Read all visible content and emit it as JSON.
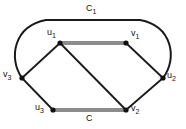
{
  "figure": {
    "kind": "graph-diagram",
    "width": 186,
    "height": 129,
    "background_color": "#ffffff"
  },
  "colors": {
    "edge_dark": "#1a1a1a",
    "edge_highlight": "#8c8c8c",
    "vertex_fill": "#111111",
    "text": "#141414"
  },
  "vertices": [
    {
      "id": "u1",
      "label": "u",
      "sub": "1",
      "x": 60,
      "y": 43,
      "label_x": 47,
      "label_y": 28
    },
    {
      "id": "v1",
      "label": "v",
      "sub": "1",
      "x": 126,
      "y": 43,
      "label_x": 131,
      "label_y": 29
    },
    {
      "id": "v3",
      "label": "v",
      "sub": "3",
      "x": 22,
      "y": 78,
      "label_x": 3,
      "label_y": 70
    },
    {
      "id": "u2",
      "label": "u",
      "sub": "2",
      "x": 163,
      "y": 78,
      "label_x": 167,
      "label_y": 71
    },
    {
      "id": "u3",
      "label": "u",
      "sub": "3",
      "x": 53,
      "y": 110,
      "label_x": 35,
      "label_y": 103
    },
    {
      "id": "v2",
      "label": "v",
      "sub": "2",
      "x": 126,
      "y": 110,
      "label_x": 131,
      "label_y": 104
    }
  ],
  "edges": [
    {
      "id": "u1-v1",
      "from": "u1",
      "to": "v1",
      "style": "highlight"
    },
    {
      "id": "u3-v2",
      "from": "u3",
      "to": "v2",
      "style": "highlight"
    },
    {
      "id": "u1-v3",
      "from": "u1",
      "to": "v3",
      "style": "dark"
    },
    {
      "id": "u1-v2",
      "from": "u1",
      "to": "v2",
      "style": "dark"
    },
    {
      "id": "v3-u3",
      "from": "v3",
      "to": "u3",
      "style": "dark"
    },
    {
      "id": "v1-u2",
      "from": "v1",
      "to": "u2",
      "style": "dark"
    },
    {
      "id": "v2-u2",
      "from": "v2",
      "to": "u2",
      "style": "dark"
    }
  ],
  "outer_curve": {
    "id": "c1-curve",
    "from": "v3",
    "to": "u2",
    "style": "dark",
    "path": "M 22 78 C 8 58 14 26 46 20 L 140 20 C 172 26 178 58 163 78"
  },
  "edge_labels": [
    {
      "id": "c1-label",
      "label": "C",
      "sub": "1",
      "x": 86,
      "y": 4
    },
    {
      "id": "c-label",
      "label": "C",
      "sub": "",
      "x": 86,
      "y": 114
    }
  ]
}
